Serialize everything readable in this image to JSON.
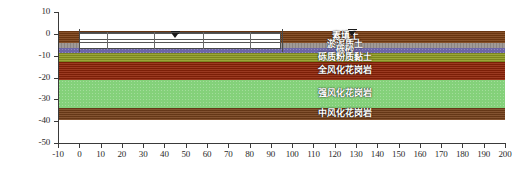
{
  "chart_data": {
    "type": "diagram",
    "title": "",
    "xlabel": "",
    "ylabel": "",
    "xlim": [
      -10,
      200
    ],
    "ylim": [
      -50,
      10
    ],
    "x_ticks": [
      "-10",
      "0",
      "10",
      "20",
      "30",
      "40",
      "50",
      "60",
      "70",
      "80",
      "90",
      "100",
      "110",
      "120",
      "130",
      "140",
      "150",
      "160",
      "170",
      "180",
      "190",
      "200"
    ],
    "y_ticks": [
      "10",
      "0",
      "-10",
      "-20",
      "-30",
      "-40",
      "-50"
    ],
    "grid": false,
    "legend": "none",
    "soil_layers": [
      {
        "name": "plain-fill",
        "label": "素填土",
        "top": 1.5,
        "bottom": -4.0,
        "color": "#7a3f14"
      },
      {
        "name": "silty-mud",
        "label": "淤泥质土",
        "top": -4.0,
        "bottom": -6.5,
        "color": "#9a9490"
      },
      {
        "name": "gravel-sand",
        "label": "砾砂",
        "top": -6.5,
        "bottom": -9.0,
        "color": "#6d66a8"
      },
      {
        "name": "gravelly-silty-clay",
        "label": "砾质粉质黏土",
        "top": -9.0,
        "bottom": -13.0,
        "color": "#8f9c24"
      },
      {
        "name": "completely-weathered-granite",
        "label": "全风化花岗岩",
        "top": -13.0,
        "bottom": -21.0,
        "color": "#8f2408"
      },
      {
        "name": "strongly-weathered-granite",
        "label": "强风化花岗岩",
        "top": -21.0,
        "bottom": -34.0,
        "color": "#84d17a"
      },
      {
        "name": "moderately-weathered-granite",
        "label": "中风化花岗岩",
        "top": -34.0,
        "bottom": -39.5,
        "color": "#75401a"
      }
    ],
    "excavation": {
      "name": "excavation-pit",
      "x_start": 0,
      "x_end": 95,
      "top": 1.0,
      "bottom": -7.0,
      "strut_levels": [
        0.2,
        -2.2,
        -3.6
      ],
      "column_positions": [
        13,
        35,
        58,
        80
      ]
    },
    "water_table_marks": [
      {
        "name": "water-table-left",
        "x": 45,
        "y": 1.2
      },
      {
        "name": "water-table-right",
        "x": 128,
        "y": 2.0
      }
    ]
  },
  "axes": {
    "y_labels": [
      "10",
      "0",
      "-10",
      "-20",
      "-30",
      "-40",
      "-50"
    ],
    "x_labels": [
      "-10",
      "0",
      "10",
      "20",
      "30",
      "40",
      "50",
      "60",
      "70",
      "80",
      "90",
      "100",
      "110",
      "120",
      "130",
      "140",
      "150",
      "160",
      "170",
      "180",
      "190",
      "200"
    ]
  }
}
